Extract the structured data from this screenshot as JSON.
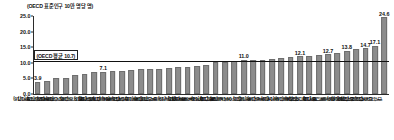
{
  "chart_data": {
    "type": "bar",
    "title": "",
    "unit_caption": "(OECD 표준인구 10만 명당 명)",
    "xlabel": "",
    "ylabel": "",
    "ylim": [
      0.0,
      25.0
    ],
    "ytick_labels": [
      "0.0",
      "5.0",
      "10.0",
      "15.0",
      "20.0",
      "25.0"
    ],
    "ytick_values": [
      0.0,
      5.0,
      10.0,
      15.0,
      20.0,
      25.0
    ],
    "grid": false,
    "legend": "none",
    "bar_color": "#8c8c8c",
    "average_line": {
      "label": "(OECD 평균 10.7)",
      "value": 10.7,
      "color": "#111111"
    },
    "categories": [
      "그리스('16)",
      "튀르키예('17)",
      "콜롬비아('18)",
      "이스라엘('18)",
      "이탈리아('17)",
      "멕시코('19)",
      "영국('18)",
      "스페인('18)",
      "코스타리카('18)",
      "아일랜드('17)",
      "네덜란드('19)",
      "포르투갈('18)",
      "브라질('17)",
      "덴마크('18)",
      "노르웨이('18)",
      "독일('19)",
      "칠레('18)",
      "뉴질랜드('17)",
      "룩셈부르크('19)",
      "캐나다('18)",
      "스위스('17)",
      "오스트리아('19)",
      "아이슬란드('18)",
      "체코('19)",
      "프랑스('16)",
      "스웨덴('18)",
      "호주('19)",
      "폴란드('19)",
      "핀란드('19)",
      "미국('18)",
      "에스토니아('19)",
      "벨기에('17)",
      "슬로베니아('19)",
      "일본('19)",
      "헝가리('19)",
      "라트비아('19)",
      "리투아니아('19)",
      "대한민국('19)"
    ],
    "values": [
      3.9,
      4.3,
      5.0,
      5.2,
      6.2,
      6.4,
      6.9,
      7.1,
      7.3,
      7.3,
      7.7,
      7.9,
      8.0,
      8.1,
      8.4,
      8.7,
      8.8,
      9.0,
      9.4,
      10.2,
      10.4,
      10.6,
      11.0,
      11.0,
      11.0,
      11.2,
      11.4,
      11.8,
      12.1,
      12.3,
      12.5,
      12.7,
      13.3,
      13.8,
      14.3,
      14.7,
      15.4,
      24.6
    ],
    "labeled_values": {
      "0": "3.9",
      "7": "7.1",
      "22": "11.0",
      "28": "12.1",
      "31": "12.7",
      "33": "13.8",
      "35": "14.7",
      "36": "15.4",
      "37": "24.6"
    },
    "extra_labeled": {
      "36b": "17.1"
    },
    "annotations": [
      {
        "text": "3.9",
        "value": 3.9
      },
      {
        "text": "7.1",
        "value": 7.1
      },
      {
        "text": "11.0",
        "value": 11.0
      },
      {
        "text": "12.1",
        "value": 12.1
      },
      {
        "text": "12.7",
        "value": 12.7
      },
      {
        "text": "13.8",
        "value": 13.8
      },
      {
        "text": "14.7",
        "value": 14.7
      },
      {
        "text": "15.4",
        "value": 15.4
      },
      {
        "text": "17.1",
        "value": 17.1
      },
      {
        "text": "24.6",
        "value": 24.6
      }
    ]
  }
}
